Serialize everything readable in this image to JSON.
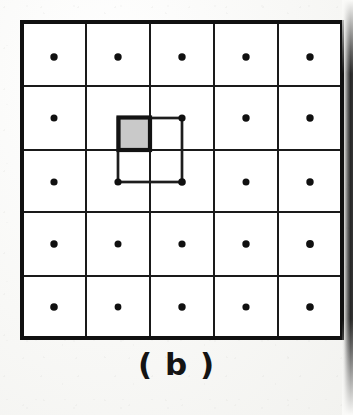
{
  "figure": {
    "caption": "( b )",
    "kind": "pixel-grid-diagram",
    "background_color": "#fbfbf9",
    "ink_color": "#141414"
  },
  "grid": {
    "rows": 5,
    "cols": 5,
    "origin_x": 22,
    "origin_y": 22,
    "x_lines": [
      22,
      86,
      150,
      214,
      278,
      342
    ],
    "y_lines": [
      22,
      86,
      150,
      212,
      276,
      338
    ],
    "outer_border_width": 4,
    "inner_line_width": 2.4,
    "line_color": "#121212",
    "cell_fill": "#ffffff",
    "sample_dots": {
      "label": "sample-point",
      "radius": 3.6,
      "color": "#101010",
      "centers_x": [
        54,
        118,
        182,
        246,
        310
      ],
      "centers_y": [
        57,
        118,
        182,
        244,
        307
      ]
    }
  },
  "highlight": {
    "inner_square": {
      "label": "interpolation-cell",
      "x": 118,
      "y": 118,
      "width": 64,
      "height": 64,
      "stroke": "#1a1a1a",
      "stroke_width": 2.6,
      "fill": "none"
    },
    "shaded_cell": {
      "label": "shaded-subpixel",
      "x": 118,
      "y": 117,
      "width": 32,
      "height": 33,
      "fill": "#c9c9c9",
      "stroke": "#141414",
      "stroke_width": 4
    },
    "corner_dots": [
      {
        "cx": 118,
        "cy": 118
      },
      {
        "cx": 182,
        "cy": 118
      },
      {
        "cx": 118,
        "cy": 182
      },
      {
        "cx": 182,
        "cy": 182
      }
    ]
  }
}
